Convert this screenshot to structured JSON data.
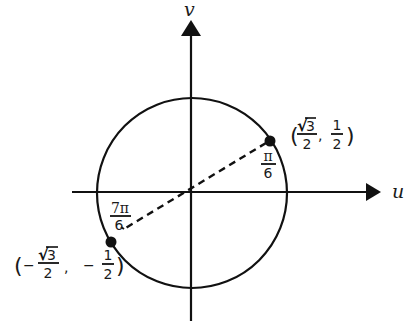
{
  "diagram": {
    "colors": {
      "stroke": "#111111",
      "text": "#1a1a1a",
      "background": "#ffffff"
    },
    "axes": {
      "horizontal": {
        "label": "u"
      },
      "vertical": {
        "label": "v"
      }
    },
    "circle": {
      "type": "unit-circle"
    },
    "points": [
      {
        "id": "point-pi-over-6",
        "angle": {
          "numerator": "π",
          "denominator": "6"
        },
        "coordinates": {
          "open": "(",
          "x": {
            "sign": "",
            "numerator_radical": "√",
            "numerator_radicand": "3",
            "denominator": "2"
          },
          "separator": ",",
          "y": {
            "sign": "",
            "numerator": "1",
            "denominator": "2"
          },
          "close": ")"
        }
      },
      {
        "id": "point-7pi-over-6",
        "angle": {
          "numerator": "7π",
          "denominator": "6"
        },
        "coordinates": {
          "open": "(",
          "x": {
            "sign": "−",
            "numerator_radical": "√",
            "numerator_radicand": "3",
            "denominator": "2"
          },
          "separator": ",",
          "y": {
            "sign": "−",
            "numerator": "1",
            "denominator": "2"
          },
          "close": ")"
        }
      }
    ],
    "connector": {
      "style": "dashed",
      "description": "Diameter through origin joining the two points"
    }
  }
}
